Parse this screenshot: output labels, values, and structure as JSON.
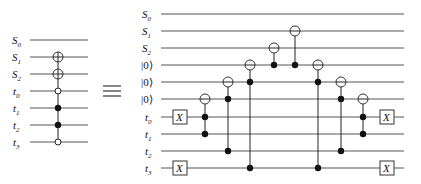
{
  "equivalence_symbol": "≡",
  "left_circuit": {
    "wires": [
      {
        "label": "S",
        "sub": "0",
        "y": 40
      },
      {
        "label": "S",
        "sub": "1",
        "y": 57
      },
      {
        "label": "S",
        "sub": "2",
        "y": 74
      },
      {
        "label": "t",
        "sub": "0",
        "y": 91
      },
      {
        "label": "t",
        "sub": "1",
        "y": 108
      },
      {
        "label": "t",
        "sub": "2",
        "y": 125
      },
      {
        "label": "t",
        "sub": "3",
        "y": 142
      }
    ],
    "gate": {
      "type": "multi-controlled-X",
      "targets": [
        "S1",
        "S2"
      ],
      "controls_filled": [
        "t1",
        "t2"
      ],
      "controls_open": [
        "t0",
        "t3"
      ]
    }
  },
  "right_circuit": {
    "wires": [
      {
        "label": "S",
        "sub": "0",
        "kind": "var"
      },
      {
        "label": "S",
        "sub": "1",
        "kind": "var"
      },
      {
        "label": "S",
        "sub": "2",
        "kind": "var"
      },
      {
        "label": "|0⟩",
        "sub": "",
        "kind": "ket"
      },
      {
        "label": "|0⟩",
        "sub": "",
        "kind": "ket"
      },
      {
        "label": "|0⟩",
        "sub": "",
        "kind": "ket"
      },
      {
        "label": "t",
        "sub": "0",
        "kind": "var"
      },
      {
        "label": "t",
        "sub": "1",
        "kind": "var"
      },
      {
        "label": "t",
        "sub": "2",
        "kind": "var"
      },
      {
        "label": "t",
        "sub": "3",
        "kind": "var"
      }
    ],
    "x_gate_label": "X",
    "gates": [
      {
        "type": "X",
        "wire": 6,
        "column": 1
      },
      {
        "type": "X",
        "wire": 9,
        "column": 1
      },
      {
        "type": "CCX",
        "target": 5,
        "controls": [
          6,
          7
        ],
        "column": 2
      },
      {
        "type": "CCX",
        "target": 4,
        "controls": [
          5,
          8
        ],
        "column": 3
      },
      {
        "type": "CCX",
        "target": 3,
        "controls": [
          4,
          9
        ],
        "column": 4
      },
      {
        "type": "CX",
        "target": 2,
        "controls": [
          3
        ],
        "column": 5
      },
      {
        "type": "CX",
        "target": 1,
        "controls": [
          3
        ],
        "column": 6
      },
      {
        "type": "CCX",
        "target": 3,
        "controls": [
          4,
          9
        ],
        "column": 7
      },
      {
        "type": "CCX",
        "target": 4,
        "controls": [
          5,
          8
        ],
        "column": 8
      },
      {
        "type": "CCX",
        "target": 5,
        "controls": [
          6,
          7
        ],
        "column": 9
      },
      {
        "type": "X",
        "wire": 6,
        "column": 10
      },
      {
        "type": "X",
        "wire": 9,
        "column": 10
      }
    ]
  }
}
